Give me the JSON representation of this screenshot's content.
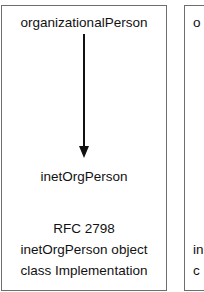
{
  "diagram": {
    "left_box": {
      "top_label": "organizationalPerson",
      "bottom_label": "inetOrgPerson",
      "arrow": "organizationalPerson → inetOrgPerson",
      "caption_lines": [
        "RFC 2798",
        "inetOrgPerson object",
        "class Implementation"
      ]
    },
    "right_box_partial": {
      "top_label_fragment": "o",
      "caption_line_fragments": [
        "in",
        "c"
      ]
    },
    "colors": {
      "border": "#6e6e6e",
      "text": "#111111",
      "arrow": "#111111",
      "background": "#ffffff"
    }
  }
}
